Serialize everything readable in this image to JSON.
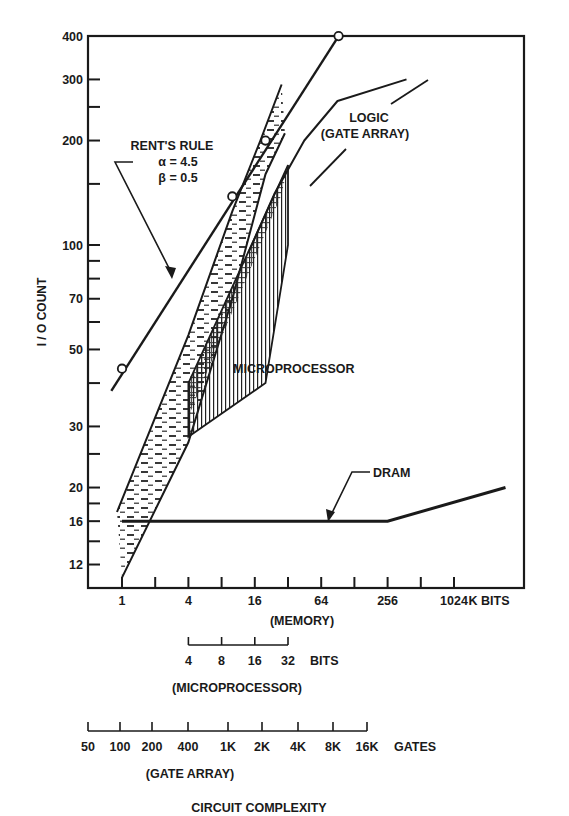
{
  "chart_data": {
    "type": "line",
    "title": "",
    "ylabel": "I / O COUNT",
    "xlabel": "CIRCUIT COMPLEXITY",
    "y_scale": "log",
    "ylim": [
      10.5,
      400
    ],
    "y_ticks_labeled": [
      400,
      300,
      200,
      100,
      70,
      50,
      30,
      20,
      16,
      12
    ],
    "y_ticks_minor": [
      250,
      150,
      90,
      80,
      60,
      40,
      25,
      18,
      14
    ],
    "x_scale": "log2",
    "xlim": [
      0.6,
      3500
    ],
    "x_axes": [
      {
        "name": "memory",
        "tick_labels": [
          "1",
          "4",
          "16",
          "64",
          "256",
          "1024"
        ],
        "tick_values": [
          1,
          4,
          16,
          64,
          256,
          1024
        ],
        "minor_values": [
          2,
          8,
          32,
          128,
          512
        ],
        "unit": "K BITS",
        "caption": "(MEMORY)"
      },
      {
        "name": "microprocessor",
        "tick_labels": [
          "4",
          "8",
          "16",
          "32"
        ],
        "tick_memory_equiv": [
          4,
          8,
          16,
          32
        ],
        "unit": "BITS",
        "caption": "(MICROPROCESSOR)"
      },
      {
        "name": "gate-array",
        "tick_labels": [
          "50",
          "100",
          "200",
          "400",
          "1K",
          "2K",
          "4K",
          "8K",
          "16K"
        ],
        "tick_memory_equiv": [
          0.5,
          1,
          2,
          4,
          8,
          16,
          32,
          64,
          128
        ],
        "unit": "GATES",
        "caption": "(GATE ARRAY)"
      }
    ],
    "series": [
      {
        "name": "RENT'S RULE",
        "annotation": [
          "RENT'S RULE",
          "α = 4.5",
          "β = 0.5"
        ],
        "line": [
          [
            0.8,
            38
          ],
          [
            92,
            400
          ]
        ],
        "markers": [
          [
            1,
            44
          ],
          [
            10,
            138
          ],
          [
            20,
            200
          ],
          [
            92,
            400
          ]
        ]
      },
      {
        "name": "LOGIC (GATE ARRAY)",
        "label": [
          "LOGIC",
          "(GATE ARRAY)"
        ],
        "line": [
          [
            14,
            95
          ],
          [
            24,
            140
          ],
          [
            45,
            200
          ],
          [
            90,
            260
          ],
          [
            380,
            300
          ]
        ]
      },
      {
        "name": "MEMORY region",
        "fill": "dashed",
        "upper_boundary": [
          [
            0.9,
            17
          ],
          [
            4,
            55
          ],
          [
            10,
            125
          ],
          [
            18,
            200
          ],
          [
            28,
            290
          ]
        ],
        "lower_boundary": [
          [
            1,
            11
          ],
          [
            4,
            27
          ],
          [
            10,
            70
          ],
          [
            20,
            160
          ],
          [
            30,
            210
          ]
        ]
      },
      {
        "name": "MICROPROCESSOR",
        "label": "MICROPROCESSOR",
        "fill": "vertical-hatch",
        "polygon": [
          [
            4,
            28
          ],
          [
            4,
            40
          ],
          [
            32,
            170
          ],
          [
            32,
            100
          ],
          [
            20,
            40
          ]
        ]
      },
      {
        "name": "DRAM",
        "label": "DRAM",
        "line": [
          [
            1,
            16
          ],
          [
            256,
            16
          ],
          [
            3000,
            20
          ]
        ]
      }
    ],
    "grid": false,
    "legend": "none"
  }
}
